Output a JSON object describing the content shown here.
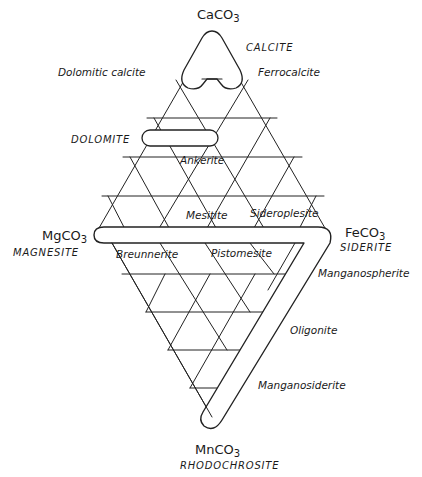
{
  "diagram": {
    "type": "ternary-carbonate-diamond",
    "vertices": {
      "top": {
        "formula": "CaCO",
        "sub": "3",
        "mineral": "CALCITE"
      },
      "left": {
        "formula": "MgCO",
        "sub": "3",
        "mineral": "MAGNESITE"
      },
      "right": {
        "formula": "FeCO",
        "sub": "3",
        "mineral": "SIDERITE"
      },
      "bottom": {
        "formula": "MnCO",
        "sub": "3",
        "mineral": "RHODOCHROSITE"
      }
    },
    "labels": {
      "dolomitic_calcite": "Dolomitic calcite",
      "ferrocalcite": "Ferrocalcite",
      "dolomite": "DOLOMITE",
      "ankerite": "Ankerite",
      "mesitite": "Mesitite",
      "sideroplesite": "Sideroplesite",
      "breunnerite": "Breunnerite",
      "pistomesite": "Pistomesite",
      "manganospherite": "Manganospherite",
      "oligonite": "Oligonite",
      "manganosiderite": "Manganosiderite"
    },
    "line_color": "#222222",
    "background": "#ffffff"
  }
}
